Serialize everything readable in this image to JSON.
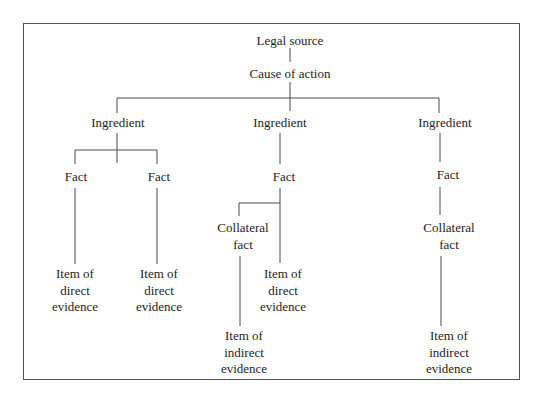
{
  "diagram": {
    "type": "tree",
    "root": "Legal source",
    "nodes": {
      "legal_source": "Legal source",
      "cause_of_action": "Cause of action",
      "ingredient_1": "Ingredient",
      "ingredient_2": "Ingredient",
      "ingredient_3": "Ingredient",
      "fact_1a": "Fact",
      "fact_1b": "Fact",
      "fact_2": "Fact",
      "fact_3": "Fact",
      "collateral_fact_2": [
        "Collateral",
        "fact"
      ],
      "collateral_fact_3": [
        "Collateral",
        "fact"
      ],
      "direct_evidence_1a": [
        "Item of",
        "direct",
        "evidence"
      ],
      "direct_evidence_1b": [
        "Item of",
        "direct",
        "evidence"
      ],
      "direct_evidence_2": [
        "Item of",
        "direct",
        "evidence"
      ],
      "indirect_evidence_2": [
        "Item of",
        "indirect",
        "evidence"
      ],
      "indirect_evidence_3": [
        "Item of",
        "indirect",
        "evidence"
      ]
    },
    "edges": [
      [
        "Legal source",
        "Cause of action"
      ],
      [
        "Cause of action",
        "Ingredient (1)"
      ],
      [
        "Cause of action",
        "Ingredient (2)"
      ],
      [
        "Cause of action",
        "Ingredient (3)"
      ],
      [
        "Ingredient (1)",
        "Fact (1a)"
      ],
      [
        "Ingredient (1)",
        "Fact (1b)"
      ],
      [
        "Fact (1a)",
        "Item of direct evidence (1a)"
      ],
      [
        "Fact (1b)",
        "Item of direct evidence (1b)"
      ],
      [
        "Ingredient (2)",
        "Fact (2)"
      ],
      [
        "Fact (2)",
        "Collateral fact (2)"
      ],
      [
        "Fact (2)",
        "Item of direct evidence (2)"
      ],
      [
        "Collateral fact (2)",
        "Item of indirect evidence (2)"
      ],
      [
        "Ingredient (3)",
        "Fact (3)"
      ],
      [
        "Fact (3)",
        "Collateral fact (3)"
      ],
      [
        "Collateral fact (3)",
        "Item of indirect evidence (3)"
      ]
    ]
  },
  "colors": {
    "line": "#4a4a4a",
    "text": "#1e1e1e",
    "border": "#555555"
  }
}
